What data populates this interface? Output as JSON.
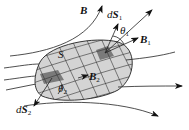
{
  "figure": {
    "type": "magnetic-flux-through-surface",
    "labels": {
      "field": "B",
      "surface": "S",
      "dS1_prefix": "d",
      "dS1_vec": "S",
      "dS1_sub": "1",
      "B1_vec": "B",
      "B1_sub": "1",
      "theta1": "θ",
      "theta1_sub": "1",
      "B2_vec": "B",
      "B2_sub": "2",
      "theta2": "θ",
      "theta2_sub": "2",
      "dS2_prefix": "d",
      "dS2_vec": "S",
      "dS2_sub": "2"
    },
    "colors": {
      "surface_fill": "#d4d4d4",
      "patch_fill": "#7a7a7a",
      "line": "#222222"
    }
  }
}
